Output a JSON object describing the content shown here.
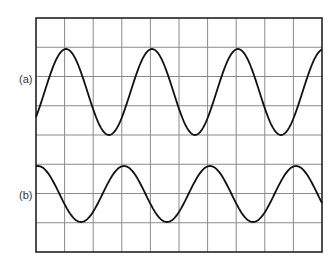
{
  "labels": {
    "a": "(a)",
    "b": "(b)"
  },
  "grid": {
    "left": 36,
    "top": 18,
    "right": 322,
    "bottom": 252,
    "cols": 10,
    "rows": 8,
    "line_color": "#8a8a8a",
    "border_color": "#222222"
  },
  "waves": [
    {
      "name": "a",
      "center_y": 92,
      "amplitude": 43,
      "period": 86,
      "phase_x_of_peak": 66,
      "color": "#111111"
    },
    {
      "name": "b",
      "center_y": 194,
      "amplitude": 28,
      "period": 86,
      "phase_x_of_peak": 38,
      "color": "#111111"
    }
  ]
}
